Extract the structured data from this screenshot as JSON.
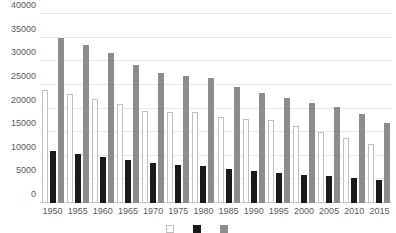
{
  "chart_data": {
    "type": "bar",
    "title": "",
    "subtitle": "",
    "xlabel": "",
    "ylabel": "",
    "grid": true,
    "legend_position": "bottom",
    "ylim": [
      0,
      40000
    ],
    "ytick_step": 5000,
    "yticks": [
      0,
      5000,
      10000,
      15000,
      20000,
      25000,
      30000,
      35000,
      40000
    ],
    "ytick_labels": [
      "0",
      "5000",
      "10000",
      "15000",
      "20000",
      "25000",
      "30000",
      "35000",
      "40000"
    ],
    "categories": [
      "1950",
      "1955",
      "1960",
      "1965",
      "1970",
      "1975",
      "1980",
      "1985",
      "1990",
      "1995",
      "2000",
      "2005",
      "2010",
      "2015"
    ],
    "series": [
      {
        "name": "series-white",
        "color": "#ffffff",
        "edge_color": "#bfbfbf",
        "values": [
          24000,
          23000,
          22000,
          21000,
          19500,
          19300,
          19200,
          18300,
          17800,
          17500,
          16300,
          15000,
          13800,
          12500
        ]
      },
      {
        "name": "series-black",
        "color": "#1a1a1a",
        "values": [
          11000,
          10400,
          9800,
          9200,
          8500,
          8000,
          7800,
          7200,
          6700,
          6300,
          6000,
          5700,
          5200,
          4800
        ]
      },
      {
        "name": "series-gray",
        "color": "#8c8c8c",
        "values": [
          35000,
          33500,
          31800,
          29300,
          27600,
          26900,
          26500,
          24500,
          23300,
          22300,
          21200,
          20300,
          18800,
          16900
        ]
      }
    ]
  },
  "legend": {
    "entries": [
      {
        "label": "",
        "swatch": "series-white"
      },
      {
        "label": "",
        "swatch": "series-black"
      },
      {
        "label": "",
        "swatch": "series-gray"
      }
    ]
  }
}
